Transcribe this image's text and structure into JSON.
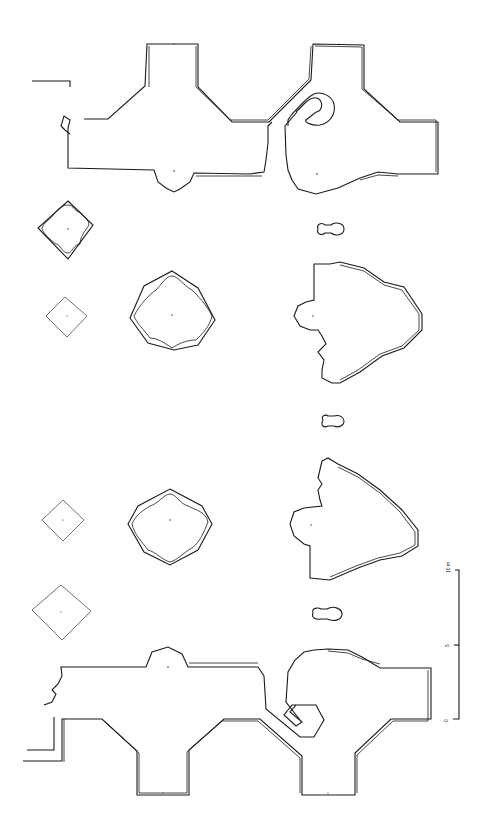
{
  "drawing": {
    "type": "architectural ground plan",
    "orientation": "rotated 90 degrees",
    "stroke_color": "#1a1a1a",
    "background_color": "#ffffff",
    "elements": [
      {
        "id": "north-wing-left",
        "label": ""
      },
      {
        "id": "north-wing-right",
        "label": ""
      },
      {
        "id": "square-chamber-1",
        "label": ""
      },
      {
        "id": "square-chamber-2",
        "label": ""
      },
      {
        "id": "rotunda-1",
        "label": ""
      },
      {
        "id": "apse-hall-1",
        "label": ""
      },
      {
        "id": "keyhole-1",
        "label": ""
      },
      {
        "id": "keyhole-2",
        "label": ""
      },
      {
        "id": "rotunda-2",
        "label": ""
      },
      {
        "id": "apse-hall-2",
        "label": ""
      },
      {
        "id": "square-chamber-3",
        "label": ""
      },
      {
        "id": "square-chamber-4",
        "label": ""
      },
      {
        "id": "keyhole-3",
        "label": ""
      },
      {
        "id": "south-wing-left",
        "label": ""
      },
      {
        "id": "south-wing-right",
        "label": ""
      }
    ]
  },
  "scale_bar": {
    "labels": [
      "0",
      "5",
      "10 m"
    ],
    "unit": "m"
  }
}
